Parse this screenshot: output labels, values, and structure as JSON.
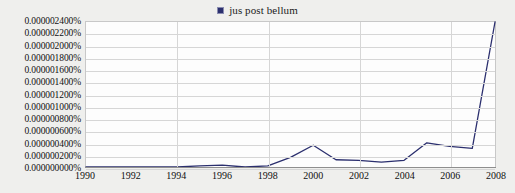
{
  "legend": {
    "entries": [
      {
        "label": "jus post bellum",
        "color": "#2b2f6e",
        "marker": "square-marker"
      }
    ]
  },
  "chart_data": {
    "type": "line",
    "title": "",
    "subtitle": "",
    "xlabel": "",
    "ylabel": "",
    "grid": true,
    "legend_position": "top-center",
    "xlim": [
      1990,
      2008
    ],
    "ylim": [
      0.0,
      2.4e-06
    ],
    "xticks": [
      1990,
      1992,
      1994,
      1996,
      1998,
      2000,
      2002,
      2004,
      2006,
      2008
    ],
    "xtick_labels": [
      "1990",
      "1992",
      "1994",
      "1996",
      "1998",
      "2000",
      "2002",
      "2004",
      "2006",
      "2008"
    ],
    "yticks": [
      2.4e-06,
      2.2e-06,
      2e-06,
      1.8e-06,
      1.6e-06,
      1.4e-06,
      1.2e-06,
      1e-06,
      8e-07,
      6e-07,
      4e-07,
      2e-07,
      0.0
    ],
    "ytick_labels": [
      "0.000002400%",
      "0.000002200%",
      "0.000002000%",
      "0.000001800%",
      "0.000001600%",
      "0.000001400%",
      "0.000001200%",
      "0.000001000%",
      "0.000000800%",
      "0.000000600%",
      "0.000000400%",
      "0.000000200%",
      "0.000000000%"
    ],
    "series": [
      {
        "name": "jus post bellum",
        "color": "#2b2f6e",
        "x": [
          1990,
          1991,
          1992,
          1993,
          1994,
          1995,
          1996,
          1997,
          1998,
          1999,
          2000,
          2001,
          2002,
          2003,
          2004,
          2005,
          2006,
          2007,
          2008
        ],
        "values": [
          0.0,
          0.0,
          0.0,
          0.0,
          0.0,
          2e-08,
          3e-08,
          0.0,
          2e-08,
          1.6e-07,
          3.6e-07,
          1.2e-07,
          1.1e-07,
          8e-08,
          1.1e-07,
          4e-07,
          3.4e-07,
          3.1e-07,
          2.4e-06
        ]
      }
    ]
  }
}
